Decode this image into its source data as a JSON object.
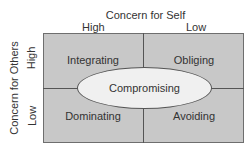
{
  "diagram": {
    "type": "2x2 matrix",
    "top_axis": {
      "title": "Concern for Self",
      "high_label": "High",
      "low_label": "Low"
    },
    "left_axis": {
      "title": "Concern for Others",
      "high_label": "High",
      "low_label": "Low"
    },
    "quadrants": {
      "top_left": "Integrating",
      "top_right": "Obliging",
      "bottom_left": "Dominating",
      "bottom_right": "Avoiding"
    },
    "center": "Compromising",
    "colors": {
      "quadrant_fill": "#c8c8c8",
      "ellipse_fill": "#f0f0f0",
      "lines": "#555555"
    }
  }
}
